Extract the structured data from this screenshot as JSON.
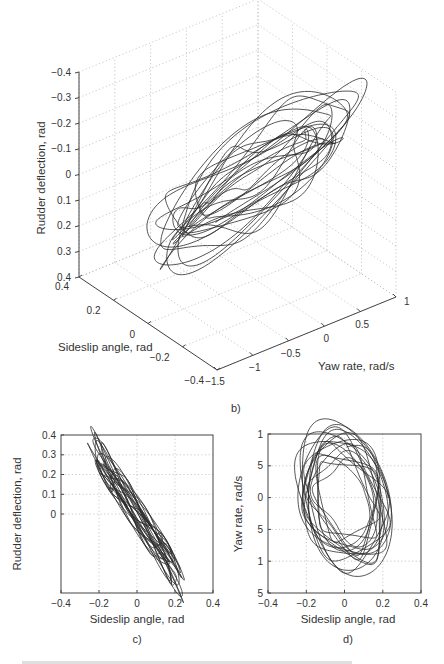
{
  "figure": {
    "panel_labels": [
      "b)",
      "c)",
      "d)"
    ],
    "caption_partial": "Fig. ... Phase trajectories for modified Dutch-roll limit cycle (caption cut off)"
  },
  "chart_data": [
    {
      "id": "b",
      "type": "line3d",
      "title": "",
      "panel_label": "b)",
      "xlabel": "Sideslip angle, rad",
      "ylabel": "Yaw rate, rad/s",
      "zlabel": "Rudder deflection, rad",
      "xlim": [
        -0.4,
        0.4
      ],
      "ylim": [
        -1.5,
        1
      ],
      "zlim": [
        -0.4,
        0.4
      ],
      "xticks": [
        "0.4",
        "0.2",
        "0",
        "−0.2",
        "−0.4"
      ],
      "yticks": [
        "−1.5",
        "−1",
        "−0.5",
        "0",
        "0.5",
        "1"
      ],
      "zticks": [
        "0.4",
        "0.3",
        "0.2",
        "0.1",
        "0",
        "−0.1",
        "−0.2",
        "−0.3",
        "−0.4"
      ],
      "grid": true,
      "description": "Quasi-periodic limit-cycle trajectory forming an elongated tilted ellipsoidal bundle of loops",
      "ranges_observed": {
        "sideslip": [
          -0.22,
          0.22
        ],
        "yaw_rate": [
          -1.0,
          0.95
        ],
        "rudder": [
          -0.32,
          0.34
        ]
      }
    },
    {
      "id": "c",
      "type": "line",
      "panel_label": "c)",
      "xlabel": "Sideslip angle, rad",
      "ylabel": "Rudder deflection, rad",
      "xlim": [
        -0.4,
        0.4
      ],
      "ylim": [
        -0.4,
        0.4
      ],
      "xticks": [
        "−0.4",
        "−0.2",
        "0",
        "0.2",
        "0.4"
      ],
      "yticks": [
        "0.4",
        "0.3",
        "0.2",
        "0.1",
        "0",
        "−0.1",
        "−0.2",
        "−0.3",
        "−0.4"
      ],
      "grid": true,
      "description": "Narrow elongated loops along a negative-slope diagonal, roughly rudder ≈ −1.5 × sideslip",
      "ranges_observed": {
        "x": [
          -0.22,
          0.22
        ],
        "y": [
          -0.31,
          0.34
        ]
      }
    },
    {
      "id": "d",
      "type": "line",
      "panel_label": "d)",
      "xlabel": "Sideslip angle, rad",
      "ylabel": "Yaw rate, rad/s",
      "xlim": [
        -0.4,
        0.4
      ],
      "ylim": [
        -1.5,
        1
      ],
      "xticks": [
        "−0.4",
        "−0.2",
        "0",
        "0.2",
        "0.4"
      ],
      "yticks": [
        "1",
        "5",
        "0",
        "5",
        "1",
        "5"
      ],
      "ytick_values": [
        1,
        0.5,
        0,
        -0.5,
        -1,
        -1.5
      ],
      "grid": true,
      "description": "Nested near-elliptical loops centered near (0,0), with small inner figure-eight loops",
      "ranges_observed": {
        "x": [
          -0.22,
          0.22
        ],
        "y": [
          -1.0,
          0.95
        ]
      }
    }
  ]
}
